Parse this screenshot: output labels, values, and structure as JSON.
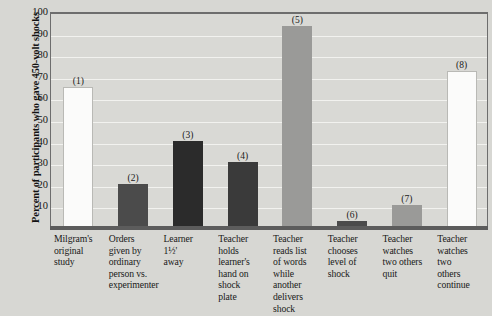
{
  "chart_data": {
    "type": "bar",
    "title": "",
    "xlabel": "",
    "ylabel": "Percent of participants who gave 450-volt shocks",
    "ylim": [
      0,
      100
    ],
    "ytick_labels": [
      "100",
      "90",
      "80",
      "70",
      "60",
      "50",
      "40",
      "30",
      "20",
      "10"
    ],
    "ytick_values": [
      100,
      90,
      80,
      70,
      60,
      50,
      40,
      30,
      20,
      10
    ],
    "grid": true,
    "legend": "none",
    "categories": [
      "Milgram's original study",
      "Orders given by ordinary person vs. experimenter",
      "Learner 1½' away",
      "Teacher holds learner's hand on shock plate",
      "Teacher reads list of words while another delivers shock",
      "Teacher chooses level of shock",
      "Teacher watches two others quit",
      "Teacher watches two others continue"
    ],
    "values": [
      65,
      20,
      40,
      30,
      93,
      3,
      10,
      72
    ],
    "point_labels": [
      "(1)",
      "(2)",
      "(3)",
      "(4)",
      "(5)",
      "(6)",
      "(7)",
      "(8)"
    ],
    "bar_colors": [
      "#fbfbfa",
      "#4b4b4b",
      "#2b2b2b",
      "#3a3a3a",
      "#9a9a98",
      "#4b4b4b",
      "#9a9a98",
      "#fbfbfa"
    ],
    "bar_styles": [
      "light",
      "dark",
      "darker",
      "dark3",
      "mid",
      "dark",
      "mid",
      "light"
    ]
  },
  "category_lines": [
    [
      "Milgram's",
      "original",
      "study"
    ],
    [
      "Orders",
      "given by",
      "ordinary",
      "person vs.",
      "experimenter"
    ],
    [
      "Learner",
      "1½'",
      "away"
    ],
    [
      "Teacher",
      "holds",
      "learner's",
      "hand on",
      "shock",
      "plate"
    ],
    [
      "Teacher",
      "reads list",
      "of words",
      "while",
      "another",
      "delivers",
      "shock"
    ],
    [
      "Teacher",
      "chooses",
      "level of",
      "shock"
    ],
    [
      "Teacher",
      "watches",
      "two others",
      "quit"
    ],
    [
      "Teacher",
      "watches",
      "two",
      "others",
      "continue"
    ]
  ],
  "colors": {
    "background": "#d7d7d3",
    "plot_background": "#d9d9d5",
    "gridline": "#f2f2ef",
    "axis": "#5c5c5c",
    "text": "#1b1b1b"
  }
}
